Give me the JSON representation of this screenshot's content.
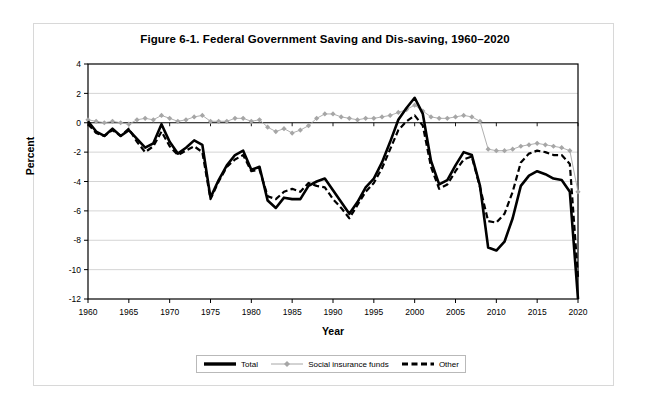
{
  "figure": {
    "title": "Figure 6-1. Federal Government Saving and Dis-saving, 1960–2020",
    "xlabel": "Year",
    "ylabel": "Percent"
  },
  "legend": {
    "items": [
      {
        "label": "Total",
        "style": "solid-thick",
        "color": "#000000"
      },
      {
        "label": "Social insurance funds",
        "style": "thin-diamond",
        "color": "#a6a6a6"
      },
      {
        "label": "Other",
        "style": "dashed-thick",
        "color": "#000000"
      }
    ]
  },
  "chart_data": {
    "type": "line",
    "title": "Figure 6-1. Federal Government Saving and Dis-saving, 1960–2020",
    "xlabel": "Year",
    "ylabel": "Percent",
    "xlim": [
      1960,
      2020
    ],
    "ylim": [
      -12,
      4
    ],
    "yticks": [
      4,
      2,
      0,
      -2,
      -4,
      -6,
      -8,
      -10,
      -12
    ],
    "xticks": [
      1960,
      1965,
      1970,
      1975,
      1980,
      1985,
      1990,
      1995,
      2000,
      2005,
      2010,
      2015,
      2020
    ],
    "grid": "horizontal",
    "legend_position": "below-axes",
    "x": [
      1960,
      1961,
      1962,
      1963,
      1964,
      1965,
      1966,
      1967,
      1968,
      1969,
      1970,
      1971,
      1972,
      1973,
      1974,
      1975,
      1976,
      1977,
      1978,
      1979,
      1980,
      1981,
      1982,
      1983,
      1984,
      1985,
      1986,
      1987,
      1988,
      1989,
      1990,
      1991,
      1992,
      1993,
      1994,
      1995,
      1996,
      1997,
      1998,
      1999,
      2000,
      2001,
      2002,
      2003,
      2004,
      2005,
      2006,
      2007,
      2008,
      2009,
      2010,
      2011,
      2012,
      2013,
      2014,
      2015,
      2016,
      2017,
      2018,
      2019,
      2020
    ],
    "series": [
      {
        "name": "Total",
        "style": "solid-thick",
        "color": "#000000",
        "values": [
          0.1,
          -0.6,
          -0.9,
          -0.4,
          -0.9,
          -0.5,
          -1.1,
          -1.7,
          -1.4,
          -0.1,
          -1.3,
          -2.1,
          -1.7,
          -1.2,
          -1.5,
          -5.1,
          -3.9,
          -2.9,
          -2.2,
          -1.9,
          -3.2,
          -3.0,
          -5.3,
          -5.8,
          -5.1,
          -5.2,
          -5.2,
          -4.3,
          -4.0,
          -3.8,
          -4.6,
          -5.4,
          -6.2,
          -5.4,
          -4.4,
          -3.8,
          -2.7,
          -1.3,
          0.2,
          1.0,
          1.7,
          0.6,
          -2.6,
          -4.2,
          -3.9,
          -2.9,
          -2.0,
          -2.2,
          -4.3,
          -8.5,
          -8.7,
          -8.1,
          -6.5,
          -4.3,
          -3.6,
          -3.3,
          -3.5,
          -3.8,
          -3.9,
          -4.7,
          -12.0
        ]
      },
      {
        "name": "Social insurance funds",
        "style": "thin-diamond",
        "color": "#a6a6a6",
        "values": [
          0.2,
          0.1,
          0.0,
          0.1,
          0.0,
          -0.1,
          0.2,
          0.3,
          0.2,
          0.5,
          0.3,
          0.1,
          0.2,
          0.4,
          0.5,
          0.1,
          0.1,
          0.1,
          0.3,
          0.3,
          0.1,
          0.2,
          -0.3,
          -0.6,
          -0.4,
          -0.7,
          -0.5,
          -0.2,
          0.3,
          0.6,
          0.6,
          0.4,
          0.3,
          0.2,
          0.3,
          0.3,
          0.4,
          0.5,
          0.7,
          0.9,
          1.2,
          0.8,
          0.4,
          0.3,
          0.3,
          0.4,
          0.5,
          0.4,
          0.1,
          -1.8,
          -1.9,
          -1.9,
          -1.8,
          -1.6,
          -1.5,
          -1.4,
          -1.5,
          -1.6,
          -1.7,
          -1.9,
          -4.7
        ]
      },
      {
        "name": "Other",
        "style": "dashed-thick",
        "color": "#000000",
        "values": [
          -0.1,
          -0.7,
          -0.9,
          -0.5,
          -0.9,
          -0.4,
          -1.3,
          -2.0,
          -1.6,
          -0.6,
          -1.6,
          -2.2,
          -1.9,
          -1.6,
          -2.0,
          -5.2,
          -4.0,
          -3.0,
          -2.5,
          -2.2,
          -3.3,
          -3.2,
          -5.0,
          -5.2,
          -4.7,
          -4.5,
          -4.7,
          -4.1,
          -4.3,
          -4.4,
          -5.2,
          -5.8,
          -6.5,
          -5.6,
          -4.7,
          -4.1,
          -3.1,
          -1.8,
          -0.5,
          0.1,
          0.5,
          -0.2,
          -3.0,
          -4.5,
          -4.2,
          -3.3,
          -2.5,
          -2.3,
          -4.4,
          -6.7,
          -6.8,
          -6.2,
          -4.7,
          -2.7,
          -2.1,
          -1.9,
          -2.0,
          -2.2,
          -2.2,
          -2.8,
          -10.5
        ]
      }
    ]
  }
}
